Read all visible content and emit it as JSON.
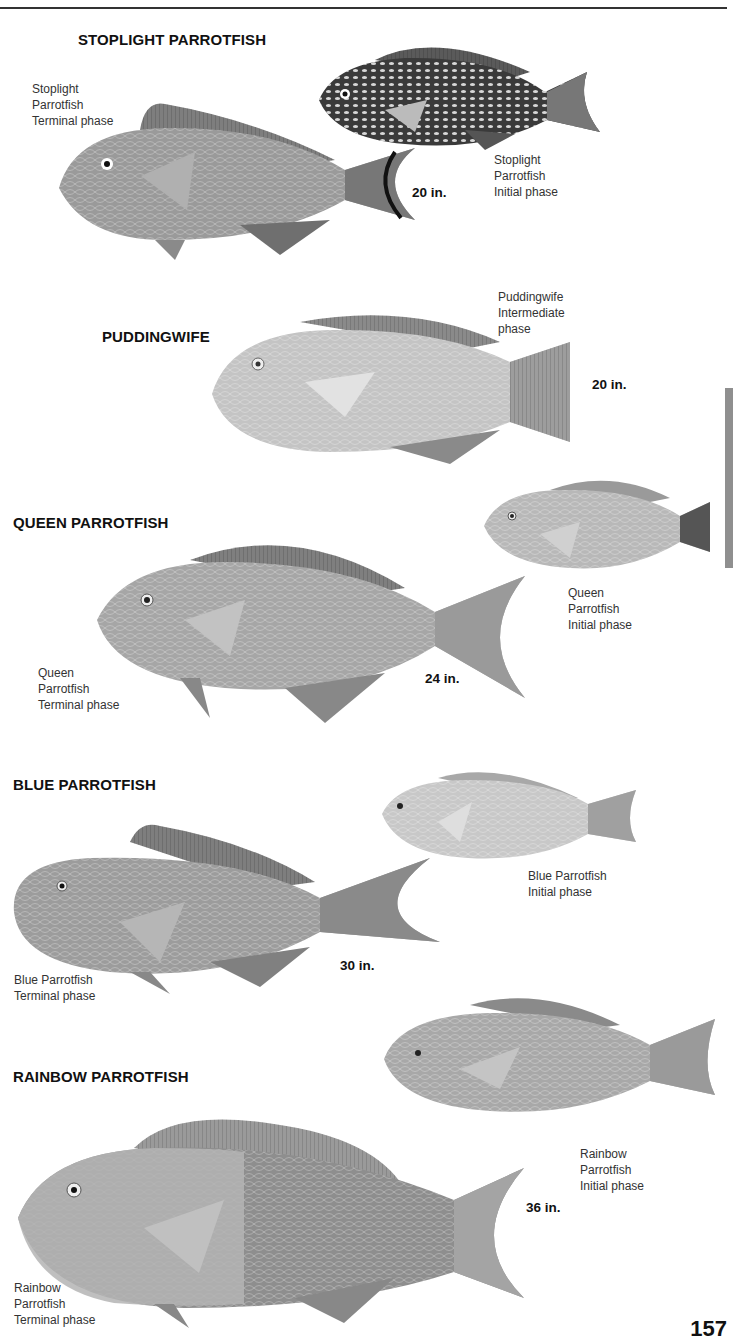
{
  "page": {
    "page_number": "157",
    "colors": {
      "rule": "#333333",
      "side_tab": "#8f8f8f",
      "text": "#1a1a1a"
    }
  },
  "species": [
    {
      "heading": "STOPLIGHT PARROTFISH",
      "max_size": "20 in.",
      "illustrations": [
        {
          "caption": "Stoplight\nParrotfish\nTerminal phase",
          "shade": "#9a9a9a"
        },
        {
          "caption": "Stoplight\nParrotfish\nInitial phase",
          "shade": "#3a3a3a"
        }
      ]
    },
    {
      "heading": "PUDDINGWIFE",
      "max_size": "20 in.",
      "illustrations": [
        {
          "caption": "Puddingwife\nIntermediate\nphase",
          "shade": "#c4c4c4"
        }
      ]
    },
    {
      "heading": "QUEEN PARROTFISH",
      "max_size": "24 in.",
      "illustrations": [
        {
          "caption": "Queen\nParrotfish\nTerminal phase",
          "shade": "#a6a6a6"
        },
        {
          "caption": "Queen\nParrotfish\nInitial phase",
          "shade": "#b8b8b8"
        }
      ]
    },
    {
      "heading": "BLUE PARROTFISH",
      "max_size": "30 in.",
      "illustrations": [
        {
          "caption": "Blue Parrotfish\nTerminal phase",
          "shade": "#9c9c9c"
        },
        {
          "caption": "Blue Parrotfish\nInitial phase",
          "shade": "#c8c8c8"
        }
      ]
    },
    {
      "heading": "RAINBOW PARROTFISH",
      "max_size": "36 in.",
      "illustrations": [
        {
          "caption": "Rainbow\nParrotfish\nTerminal phase",
          "shade": "#8e8e8e"
        },
        {
          "caption": "Rainbow\nParrotfish\nInitial phase",
          "shade": "#a8a8a8"
        }
      ]
    }
  ]
}
